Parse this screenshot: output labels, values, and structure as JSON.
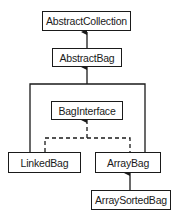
{
  "diagram": {
    "type": "class-hierarchy",
    "nodes": [
      {
        "id": "abstract_collection",
        "label": "AbstractCollection"
      },
      {
        "id": "abstract_bag",
        "label": "AbstractBag"
      },
      {
        "id": "bag_interface",
        "label": "BagInterface"
      },
      {
        "id": "linked_bag",
        "label": "LinkedBag"
      },
      {
        "id": "array_bag",
        "label": "ArrayBag"
      },
      {
        "id": "array_sorted_bag",
        "label": "ArraySortedBag"
      }
    ],
    "edges": [
      {
        "from": "abstract_bag",
        "to": "abstract_collection",
        "style": "solid"
      },
      {
        "from": "linked_bag",
        "to": "abstract_bag",
        "style": "solid"
      },
      {
        "from": "array_bag",
        "to": "abstract_bag",
        "style": "solid"
      },
      {
        "from": "linked_bag",
        "to": "bag_interface",
        "style": "dashed"
      },
      {
        "from": "array_bag",
        "to": "bag_interface",
        "style": "dashed"
      },
      {
        "from": "array_sorted_bag",
        "to": "array_bag",
        "style": "solid"
      }
    ],
    "colors": {
      "line": "#1a1a1a",
      "background": "#ffffff"
    }
  }
}
